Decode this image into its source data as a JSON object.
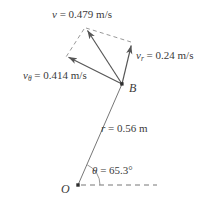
{
  "diagram": {
    "type": "vector-decomposition-polar",
    "stroke_color": "#555555",
    "text_color": "#3a3a3a",
    "background": "#ffffff",
    "points": {
      "origin": {
        "label": "O",
        "x": 78,
        "y": 185
      },
      "body": {
        "label": "B",
        "x": 122,
        "y": 84
      }
    },
    "labels": {
      "velocity": {
        "symbol": "v",
        "subscript": "",
        "text": " = 0.479 m/s",
        "value": 0.479,
        "unit": "m/s"
      },
      "radial_velocity": {
        "symbol": "v",
        "subscript": "r",
        "text": " = 0.24 m/s",
        "value": 0.24,
        "unit": "m/s"
      },
      "transverse_velocity": {
        "symbol": "v",
        "subscript": "θ",
        "text": " = 0.414 m/s",
        "value": 0.414,
        "unit": "m/s"
      },
      "radius": {
        "symbol": "r",
        "subscript": "",
        "text": " = 0.56 m",
        "value": 0.56,
        "unit": "m"
      },
      "angle": {
        "symbol": "θ",
        "subscript": "",
        "text": " = 65.3°",
        "value": 65.3,
        "unit": "°"
      }
    },
    "vectors": {
      "resultant": {
        "name": "v",
        "from": [
          122,
          84
        ],
        "to": [
          85,
          27
        ]
      },
      "radial": {
        "name": "v_r",
        "from": [
          122,
          84
        ],
        "to": [
          132,
          42
        ]
      },
      "transverse": {
        "name": "v_theta",
        "from": [
          122,
          84
        ],
        "to": [
          65,
          58
        ]
      }
    },
    "construction_lines": {
      "radius_line": {
        "from": [
          78,
          185
        ],
        "to": [
          122,
          84
        ]
      },
      "reference_axis": {
        "from": [
          78,
          185
        ],
        "to": [
          157,
          185
        ],
        "style": "dashed"
      },
      "parallelogram_side_a": {
        "from": [
          85,
          27
        ],
        "to": [
          132,
          42
        ],
        "style": "dashed"
      },
      "parallelogram_side_b": {
        "from": [
          85,
          27
        ],
        "to": [
          65,
          58
        ],
        "style": "dashed"
      }
    }
  }
}
